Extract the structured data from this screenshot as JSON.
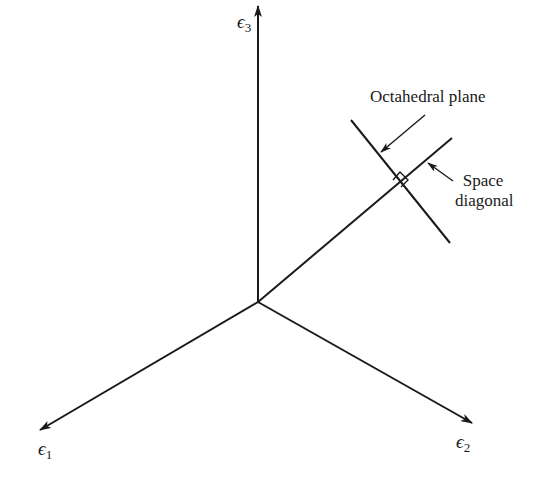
{
  "diagram": {
    "axes": [
      {
        "id": "e1",
        "symbol": "ϵ",
        "subscript": "1",
        "direction": "lower-left"
      },
      {
        "id": "e2",
        "symbol": "ϵ",
        "subscript": "2",
        "direction": "lower-right"
      },
      {
        "id": "e3",
        "symbol": "ϵ",
        "subscript": "3",
        "direction": "up"
      }
    ],
    "annotations": {
      "octahedral_plane": "Octahedral plane",
      "space_diagonal_line1": "Space",
      "space_diagonal_line2": "diagonal"
    },
    "colors": {
      "line": "#1a1a1a",
      "background": "#ffffff"
    }
  }
}
